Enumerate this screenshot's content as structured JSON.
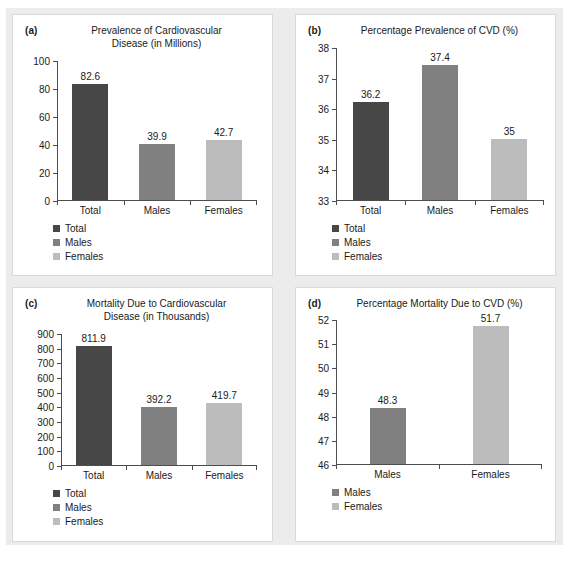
{
  "figure": {
    "background": "#ffffff",
    "mat_color": "#ececed",
    "panel_border": "#d9d9d9",
    "axis_color": "#4d4d4d",
    "text_color": "#1a1a1a"
  },
  "series_colors": {
    "Total": "#474747",
    "Males": "#808080",
    "Females": "#bcbcbc"
  },
  "panels": [
    {
      "tag": "(a)",
      "title": "Prevalence of Cardiovascular\nDisease (in Millions)",
      "title_line1": "Prevalence of Cardiovascular",
      "title_line2": "Disease (in Millions)",
      "legend": [
        "Total",
        "Males",
        "Females"
      ]
    },
    {
      "tag": "(b)",
      "title": "Percentage Prevalence of CVD (%)",
      "title_line1": "Percentage Prevalence of CVD (%)",
      "title_line2": "",
      "legend": [
        "Total",
        "Males",
        "Females"
      ]
    },
    {
      "tag": "(c)",
      "title": "Mortality Due to Cardiovascular\nDisease (in Thousands)",
      "title_line1": "Mortality Due to Cardiovascular",
      "title_line2": "Disease (in Thousands)",
      "legend": [
        "Total",
        "Males",
        "Females"
      ]
    },
    {
      "tag": "(d)",
      "title": "Percentage Mortality Due to CVD (%)",
      "title_line1": "Percentage Mortality Due to CVD (%)",
      "title_line2": "",
      "legend": [
        "Males",
        "Females"
      ]
    }
  ],
  "chart_data": [
    {
      "id": "a",
      "type": "bar",
      "title": "Prevalence of Cardiovascular Disease (in Millions)",
      "panel_tag": "(a)",
      "xlabel": "",
      "ylabel": "",
      "categories": [
        "Total",
        "Males",
        "Females"
      ],
      "values": [
        82.6,
        39.9,
        42.7
      ],
      "value_labels": [
        "82.6",
        "39.9",
        "42.7"
      ],
      "colors": [
        "#474747",
        "#808080",
        "#bcbcbc"
      ],
      "ylim": [
        0,
        100
      ],
      "yticks": [
        0,
        20,
        40,
        60,
        80,
        100
      ],
      "ytick_labels": [
        "0",
        "20",
        "40",
        "60",
        "80",
        "100"
      ],
      "grid": false,
      "legend_position": "below-left",
      "legend": [
        "Total",
        "Males",
        "Females"
      ]
    },
    {
      "id": "b",
      "type": "bar",
      "title": "Percentage Prevalence of CVD (%)",
      "panel_tag": "(b)",
      "xlabel": "",
      "ylabel": "",
      "categories": [
        "Total",
        "Males",
        "Females"
      ],
      "values": [
        36.2,
        37.4,
        35
      ],
      "value_labels": [
        "36.2",
        "37.4",
        "35"
      ],
      "colors": [
        "#474747",
        "#808080",
        "#bcbcbc"
      ],
      "ylim": [
        33,
        38
      ],
      "yticks": [
        33,
        34,
        35,
        36,
        37,
        38
      ],
      "ytick_labels": [
        "33",
        "34",
        "35",
        "36",
        "37",
        "38"
      ],
      "grid": false,
      "legend_position": "below-left",
      "legend": [
        "Total",
        "Males",
        "Females"
      ]
    },
    {
      "id": "c",
      "type": "bar",
      "title": "Mortality Due to Cardiovascular Disease (in Thousands)",
      "panel_tag": "(c)",
      "xlabel": "",
      "ylabel": "",
      "categories": [
        "Total",
        "Males",
        "Females"
      ],
      "values": [
        811.9,
        392.2,
        419.7
      ],
      "value_labels": [
        "811.9",
        "392.2",
        "419.7"
      ],
      "colors": [
        "#474747",
        "#808080",
        "#bcbcbc"
      ],
      "ylim": [
        0,
        900
      ],
      "yticks": [
        0,
        100,
        200,
        300,
        400,
        500,
        600,
        700,
        800,
        900
      ],
      "ytick_labels": [
        "0",
        "100",
        "200",
        "300",
        "400",
        "500",
        "600",
        "700",
        "800",
        "900"
      ],
      "grid": false,
      "legend_position": "below-left",
      "legend": [
        "Total",
        "Males",
        "Females"
      ]
    },
    {
      "id": "d",
      "type": "bar",
      "title": "Percentage Mortality Due to CVD (%)",
      "panel_tag": "(d)",
      "xlabel": "",
      "ylabel": "",
      "categories": [
        "Males",
        "Females"
      ],
      "values": [
        48.3,
        51.7
      ],
      "value_labels": [
        "48.3",
        "51.7"
      ],
      "colors": [
        "#808080",
        "#bcbcbc"
      ],
      "ylim": [
        46,
        52
      ],
      "yticks": [
        46,
        47,
        48,
        49,
        50,
        51,
        52
      ],
      "ytick_labels": [
        "46",
        "47",
        "48",
        "49",
        "50",
        "51",
        "52"
      ],
      "grid": false,
      "legend_position": "below-left",
      "legend": [
        "Males",
        "Females"
      ]
    }
  ]
}
